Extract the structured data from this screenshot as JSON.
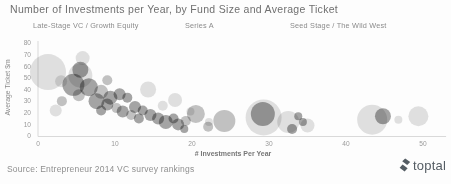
{
  "title": "Number of Investments per Year, by Fund Size and Average Ticket",
  "legend": {
    "items": [
      {
        "label": "Late-Stage VC / Growth Equity"
      },
      {
        "label": "Series A"
      },
      {
        "label": "Seed Stage / The Wild West"
      }
    ]
  },
  "chart_data": {
    "type": "scatter",
    "subtype": "bubble",
    "title": "Number of Investments per Year, by Fund Size and Average Ticket",
    "xlabel": "# Investments Per Year",
    "ylabel": "Average Ticket $m",
    "xlim": [
      0,
      53
    ],
    "ylim": [
      0,
      80
    ],
    "x_ticks": [
      0,
      10,
      20,
      30,
      40,
      50
    ],
    "y_ticks": [
      0,
      10,
      20,
      30,
      40,
      50,
      60,
      70,
      80
    ],
    "grid": false,
    "legend_position": "top",
    "axis_color": "#d9d9d9",
    "tick_color": "#9a9a9a",
    "shades": {
      "l": "#cfcfcf",
      "m": "#9e9e9e",
      "d": "#6e6e6e"
    },
    "series": [
      {
        "name": "Late-Stage VC / Growth Equity",
        "points": [
          {
            "x": 1.3,
            "y": 55,
            "r": 18,
            "c": "l"
          },
          {
            "x": 5.8,
            "y": 67,
            "r": 7,
            "c": "l"
          },
          {
            "x": 3.0,
            "y": 47,
            "r": 6,
            "c": "l"
          },
          {
            "x": 5.5,
            "y": 52,
            "r": 12,
            "c": "l"
          },
          {
            "x": 2.3,
            "y": 22,
            "r": 6,
            "c": "l"
          },
          {
            "x": 14.3,
            "y": 40,
            "r": 8,
            "c": "l"
          },
          {
            "x": 17.8,
            "y": 31,
            "r": 7,
            "c": "l"
          },
          {
            "x": 16.2,
            "y": 26,
            "r": 5,
            "c": "l"
          }
        ]
      },
      {
        "name": "Series A",
        "points": [
          {
            "x": 5.5,
            "y": 57,
            "r": 8,
            "c": "d"
          },
          {
            "x": 4.6,
            "y": 44,
            "r": 11,
            "c": "d"
          },
          {
            "x": 6.6,
            "y": 42,
            "r": 9,
            "c": "d"
          },
          {
            "x": 9.0,
            "y": 48,
            "r": 5,
            "c": "m"
          },
          {
            "x": 8.2,
            "y": 38,
            "r": 7,
            "c": "m"
          },
          {
            "x": 5.3,
            "y": 35,
            "r": 6,
            "c": "m"
          },
          {
            "x": 3.1,
            "y": 30,
            "r": 5,
            "c": "m"
          },
          {
            "x": 7.6,
            "y": 30,
            "r": 8,
            "c": "d"
          },
          {
            "x": 9.4,
            "y": 33,
            "r": 7,
            "c": "d"
          },
          {
            "x": 10.6,
            "y": 36,
            "r": 6,
            "c": "d"
          },
          {
            "x": 11.6,
            "y": 33,
            "r": 5,
            "c": "d"
          },
          {
            "x": 9.0,
            "y": 27,
            "r": 6,
            "c": "d"
          },
          {
            "x": 10.2,
            "y": 24,
            "r": 5,
            "c": "m"
          },
          {
            "x": 8.2,
            "y": 22,
            "r": 5,
            "c": "d"
          },
          {
            "x": 11.0,
            "y": 21,
            "r": 6,
            "c": "d"
          },
          {
            "x": 12.6,
            "y": 25,
            "r": 6,
            "c": "d"
          },
          {
            "x": 13.6,
            "y": 22,
            "r": 5,
            "c": "d"
          },
          {
            "x": 12.1,
            "y": 18,
            "r": 5,
            "c": "m"
          },
          {
            "x": 13.1,
            "y": 15,
            "r": 5,
            "c": "d"
          },
          {
            "x": 14.6,
            "y": 18,
            "r": 6,
            "c": "d"
          },
          {
            "x": 15.6,
            "y": 15,
            "r": 6,
            "c": "d"
          },
          {
            "x": 16.6,
            "y": 12,
            "r": 7,
            "c": "d"
          },
          {
            "x": 17.6,
            "y": 15,
            "r": 5,
            "c": "d"
          },
          {
            "x": 18.2,
            "y": 10,
            "r": 6,
            "c": "d"
          },
          {
            "x": 19.0,
            "y": 6,
            "r": 4,
            "c": "d"
          },
          {
            "x": 19.2,
            "y": 13,
            "r": 5,
            "c": "m"
          },
          {
            "x": 20.5,
            "y": 19,
            "r": 9,
            "c": "m"
          },
          {
            "x": 19.8,
            "y": 21,
            "r": 4,
            "c": "l"
          },
          {
            "x": 22.2,
            "y": 12,
            "r": 4,
            "c": "l"
          },
          {
            "x": 22.1,
            "y": 8,
            "r": 5,
            "c": "m"
          },
          {
            "x": 24.2,
            "y": 13,
            "r": 11,
            "c": "m"
          }
        ]
      },
      {
        "name": "Seed Stage / The Wild West",
        "points": [
          {
            "x": 29.3,
            "y": 16,
            "r": 18,
            "c": "l"
          },
          {
            "x": 29.2,
            "y": 19,
            "r": 12,
            "c": "d"
          },
          {
            "x": 32.5,
            "y": 12,
            "r": 11,
            "c": "l"
          },
          {
            "x": 33.8,
            "y": 17,
            "r": 4,
            "c": "d"
          },
          {
            "x": 33.0,
            "y": 6,
            "r": 5,
            "c": "d"
          },
          {
            "x": 35.0,
            "y": 9,
            "r": 7,
            "c": "l"
          },
          {
            "x": 34.4,
            "y": 12,
            "r": 4,
            "c": "d"
          },
          {
            "x": 43.4,
            "y": 14,
            "r": 15,
            "c": "l"
          },
          {
            "x": 44.8,
            "y": 17,
            "r": 8,
            "c": "d"
          },
          {
            "x": 46.8,
            "y": 14,
            "r": 4,
            "c": "l"
          },
          {
            "x": 49.4,
            "y": 17,
            "r": 10,
            "c": "l"
          }
        ]
      }
    ]
  },
  "source": "Source: Entrepreneur 2014 VC survey rankings",
  "logo": {
    "text": "toptal",
    "color": "#545c63"
  }
}
